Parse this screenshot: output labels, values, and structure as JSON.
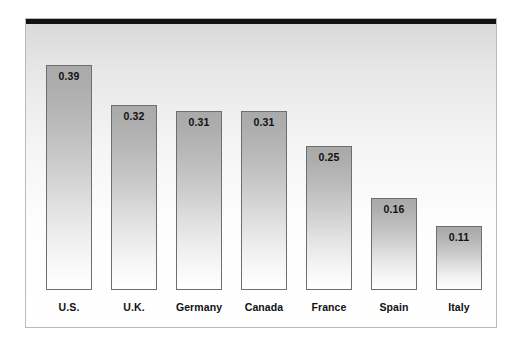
{
  "chart_data": {
    "type": "bar",
    "title": "",
    "subtitle": "",
    "xlabel": "",
    "ylabel": "",
    "grid": false,
    "legend": null,
    "ylim": [
      0,
      0.44
    ],
    "categories": [
      "U.S.",
      "U.K.",
      "Germany",
      "Canada",
      "France",
      "Spain",
      "Italy"
    ],
    "values": [
      0.39,
      0.32,
      0.31,
      0.31,
      0.25,
      0.16,
      0.11
    ],
    "value_labels": [
      "0.39",
      "0.32",
      "0.31",
      "0.31",
      "0.25",
      "0.16",
      "0.11"
    ],
    "bars": [
      {
        "category": "U.S.",
        "value": 0.39,
        "label": "0.39"
      },
      {
        "category": "U.K.",
        "value": 0.32,
        "label": "0.32"
      },
      {
        "category": "Germany",
        "value": 0.31,
        "label": "0.31"
      },
      {
        "category": "Canada",
        "value": 0.31,
        "label": "0.31"
      },
      {
        "category": "France",
        "value": 0.25,
        "label": "0.25"
      },
      {
        "category": "Spain",
        "value": 0.16,
        "label": "0.16"
      },
      {
        "category": "Italy",
        "value": 0.11,
        "label": "0.11"
      }
    ],
    "colors": {
      "bar_top": "#a9a9a9",
      "bar_bottom": "#ffffff",
      "bar_border": "#6e6e6e",
      "frame_border": "#b9b9b9",
      "top_rule": "#111111",
      "text": "#111111",
      "background_top": "#d8d8d8",
      "background_bottom": "#ffffff"
    }
  }
}
